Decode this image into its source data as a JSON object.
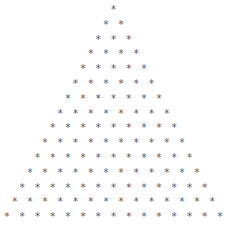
{
  "pattern": {
    "type": "star-pyramid",
    "symbol": "*",
    "rows": 15,
    "row_counts": [
      1,
      2,
      3,
      4,
      5,
      6,
      7,
      8,
      9,
      10,
      11,
      12,
      13,
      14,
      15
    ],
    "color": "#555555"
  }
}
